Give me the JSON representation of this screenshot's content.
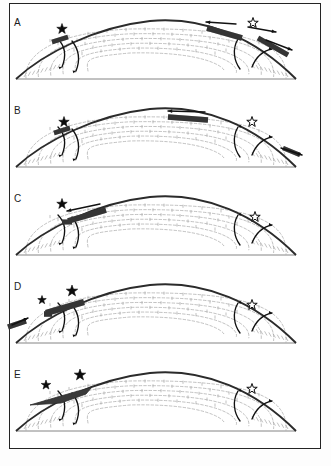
{
  "figure": {
    "panel_count": 5,
    "frame_color": "#242424",
    "background": "#ffffff",
    "caption_text": "",
    "symbols": {
      "filled_star": "★",
      "open_star": "☆",
      "filled_star_name": "active-marker",
      "open_star_name": "inactive-marker"
    },
    "colors": {
      "outline": "#2b2b2b",
      "streamline": "#a8a8a8",
      "band_fill": "#3a3a3a",
      "arrow": "#111111",
      "baseline": "#777777"
    }
  },
  "panels": [
    {
      "label": "A",
      "label_x": 14,
      "label_y": 12,
      "stars": [
        {
          "type": "filled",
          "x": 62,
          "y": 24,
          "size": 11
        },
        {
          "type": "open",
          "x": 253,
          "y": 18,
          "size": 11
        }
      ],
      "bands": [
        {
          "name": "left-detachment-band",
          "x1": 52,
          "y1": 37,
          "x2": 68,
          "y2": 32,
          "w": 4.5
        },
        {
          "name": "crest-thrust-band",
          "x1": 207,
          "y1": 23,
          "x2": 242,
          "y2": 33,
          "w": 5.5
        },
        {
          "name": "right-flank-band",
          "x1": 258,
          "y1": 33,
          "x2": 288,
          "y2": 50,
          "w": 5.0
        }
      ],
      "arrows": [
        {
          "name": "crest-arrow-left",
          "x1": 236,
          "y1": 19,
          "x2": 206,
          "y2": 17
        },
        {
          "name": "crest-arrow-right",
          "x1": 248,
          "y1": 22,
          "x2": 276,
          "y2": 27
        },
        {
          "name": "flank-arrow-right",
          "x1": 266,
          "y1": 35,
          "x2": 292,
          "y2": 45
        }
      ]
    },
    {
      "label": "B",
      "label_x": 14,
      "label_y": 12,
      "stars": [
        {
          "type": "filled",
          "x": 64,
          "y": 29,
          "size": 11
        },
        {
          "type": "open",
          "x": 252,
          "y": 29,
          "size": 11
        }
      ],
      "bands": [
        {
          "name": "left-detachment-band",
          "x1": 54,
          "y1": 40,
          "x2": 70,
          "y2": 35,
          "w": 4.5
        },
        {
          "name": "crest-thrust-band",
          "x1": 168,
          "y1": 24,
          "x2": 208,
          "y2": 27,
          "w": 5.5
        },
        {
          "name": "right-toe-band",
          "x1": 283,
          "y1": 55,
          "x2": 300,
          "y2": 62,
          "w": 4.5
        }
      ],
      "arrows": [
        {
          "name": "crest-arrow-left",
          "x1": 205,
          "y1": 19,
          "x2": 168,
          "y2": 18
        },
        {
          "name": "toe-arrow-right",
          "x1": 281,
          "y1": 55,
          "x2": 302,
          "y2": 62
        }
      ]
    },
    {
      "label": "C",
      "label_x": 14,
      "label_y": 12,
      "stars": [
        {
          "type": "filled",
          "x": 62,
          "y": 23,
          "size": 11
        },
        {
          "type": "open",
          "x": 255,
          "y": 36,
          "size": 11
        }
      ],
      "bands": [
        {
          "name": "left-thrust-band",
          "x1": 68,
          "y1": 40,
          "x2": 106,
          "y2": 29,
          "w": 5.5
        },
        {
          "name": "left-ramp-band",
          "x1": 62,
          "y1": 41,
          "x2": 72,
          "y2": 41,
          "w": 5.0
        }
      ],
      "arrows": [
        {
          "name": "crest-arrow-left",
          "x1": 100,
          "y1": 23,
          "x2": 67,
          "y2": 30
        }
      ]
    },
    {
      "label": "D",
      "label_x": 14,
      "label_y": 12,
      "stars": [
        {
          "type": "filled",
          "x": 42,
          "y": 31,
          "size": 9
        },
        {
          "type": "filled",
          "x": 72,
          "y": 22,
          "size": 12
        },
        {
          "type": "open",
          "x": 252,
          "y": 36,
          "size": 11
        }
      ],
      "bands": [
        {
          "name": "upper-thrust-sheet",
          "x1": 46,
          "y1": 44,
          "x2": 84,
          "y2": 33,
          "w": 6.5
        },
        {
          "name": "lower-ramp-band",
          "x1": 44,
          "y1": 45,
          "x2": 52,
          "y2": 45,
          "w": 5.5
        },
        {
          "name": "toe-band-left",
          "x1": 8,
          "y1": 58,
          "x2": 26,
          "y2": 52,
          "w": 5.5
        }
      ],
      "arrows": [
        {
          "name": "toe-arrow-left",
          "x1": 12,
          "y1": 56,
          "x2": 28,
          "y2": 49
        }
      ]
    },
    {
      "label": "E",
      "label_x": 14,
      "label_y": 12,
      "stars": [
        {
          "type": "filled",
          "x": 46,
          "y": 28,
          "size": 10
        },
        {
          "type": "filled",
          "x": 80,
          "y": 18,
          "size": 12
        },
        {
          "type": "open",
          "x": 252,
          "y": 32,
          "size": 11
        }
      ],
      "bands": [
        {
          "name": "accreted-wedge-mass",
          "x1": 30,
          "y1": 48,
          "x2": 92,
          "y2": 30,
          "w": 0
        }
      ],
      "arrows": []
    }
  ],
  "streamlines": {
    "name": "internal-flow-contours",
    "description": "nested dashed closed contours with tick marks",
    "loop_count": 6,
    "style": "dashed",
    "color": "#a8a8a8"
  }
}
